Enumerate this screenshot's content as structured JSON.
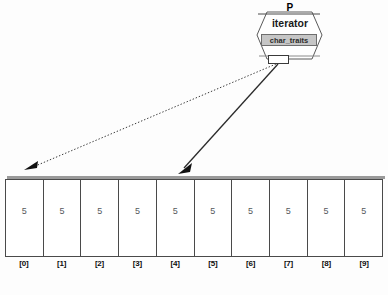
{
  "diagram": {
    "title_visible": false,
    "background_color": "#fdfdfd",
    "node": {
      "name_label": "P",
      "type_label": "iterator",
      "stereotype_label": "char_traits",
      "stereotype_bg": "#c6c6c6",
      "port_present": true,
      "shape": "hexagon",
      "fill_color": "#ffffff",
      "stroke_color": "#555555"
    },
    "connections": [
      {
        "name": "dotted-reference-arrow",
        "style": "dotted",
        "color": "#3a3a3a",
        "from": {
          "x": 279,
          "y": 64
        },
        "to": {
          "x": 27,
          "y": 170
        },
        "arrowhead": "filled-triangle"
      },
      {
        "name": "solid-reference-arrow",
        "style": "solid",
        "color": "#2b2b2b",
        "from": {
          "x": 279,
          "y": 64
        },
        "to": {
          "x": 181,
          "y": 172
        },
        "arrowhead": "filled-triangle"
      }
    ],
    "array": {
      "cell_count": 10,
      "values": [
        "5",
        "5",
        "5",
        "5",
        "5",
        "5",
        "5",
        "5",
        "5",
        "5"
      ],
      "index_labels": [
        "[0]",
        "[1]",
        "[2]",
        "[3]",
        "[4]",
        "[5]",
        "[6]",
        "[7]",
        "[8]",
        "[9]"
      ],
      "border_color": "#4a4a4a",
      "value_color": "#55595c"
    }
  }
}
